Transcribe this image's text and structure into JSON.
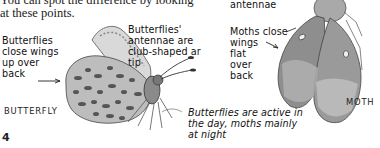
{
  "page": {
    "intro_text": "You can spot the difference by looking\nat these points.",
    "labels": {
      "butterfly_wings": "Butterflies\nclose wings\nup over\nback",
      "butterfly_antennae": "Butterflies'\nantennae are\nclub-shaped ar\ntip",
      "moth_antennae": "antennae",
      "moth_wings": "Moths close\nwings\nflat\nover\nback",
      "activity": "Butterflies are active in\nthe day, moths mainly\nat night"
    },
    "captions": {
      "butterfly": "BUTTERFLY",
      "moth": "MOTH"
    },
    "page_number": "4"
  }
}
